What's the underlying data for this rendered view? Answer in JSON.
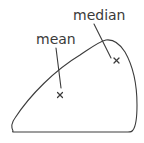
{
  "diagram": {
    "labels": {
      "median": "median",
      "mean": "mean"
    },
    "markers": [
      {
        "name": "median",
        "symbol": "×"
      },
      {
        "name": "mean",
        "symbol": "×"
      }
    ],
    "colors": {
      "stroke": "#3c3c3c",
      "text": "#3a3a3a",
      "background": "#ffffff"
    }
  }
}
